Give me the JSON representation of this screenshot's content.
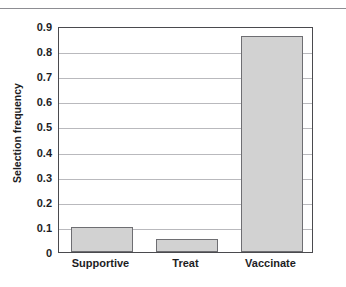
{
  "header": {
    "remnant_text": "IN THE GRAPH BELOW FOR"
  },
  "chart_data": {
    "type": "bar",
    "title": "",
    "xlabel": "",
    "ylabel": "Selection frequency",
    "categories": [
      "Supportive",
      "Treat",
      "Vaccinate"
    ],
    "values": [
      0.1,
      0.05,
      0.86
    ],
    "ylim": [
      0,
      0.9
    ],
    "ytick_labels": [
      "0",
      "0.1",
      "0.2",
      "0.3",
      "0.4",
      "0.5",
      "0.6",
      "0.7",
      "0.8",
      "0.9"
    ],
    "ytick_values": [
      0,
      0.1,
      0.2,
      0.3,
      0.4,
      0.5,
      0.6,
      0.7,
      0.8,
      0.9
    ],
    "grid": true,
    "legend": null,
    "bar_fill_color": "#d2d2d2",
    "bar_edge_color": "#6e6e72",
    "grid_color": "#b9b9bd",
    "axis_color": "#4a4a4e",
    "text_color": "#1d1d1f"
  }
}
